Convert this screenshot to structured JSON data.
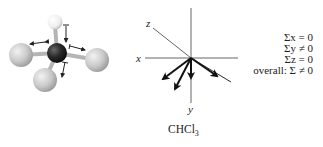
{
  "figure": {
    "molecule": {
      "name": "CHCl3 ball-and-stick model",
      "atoms": [
        {
          "element": "H",
          "label": "hydrogen",
          "color": "#f4f4f4"
        },
        {
          "element": "C",
          "label": "carbon",
          "color": "#2a2a2a"
        },
        {
          "element": "Cl",
          "label": "chlorine-left",
          "color": "#c8c8c8"
        },
        {
          "element": "Cl",
          "label": "chlorine-right",
          "color": "#c8c8c8"
        },
        {
          "element": "Cl",
          "label": "chlorine-bottom",
          "color": "#c8c8c8"
        }
      ]
    },
    "axes": {
      "x_label": "x",
      "y_label": "y",
      "z_label": "z"
    },
    "caption": {
      "formula_main": "CHCl",
      "formula_sub": "3"
    },
    "sums": [
      {
        "text": "Σx = 0"
      },
      {
        "text": "Σy ≠ 0"
      },
      {
        "text": "Σz = 0"
      },
      {
        "text": "overall: Σ ≠ 0"
      }
    ],
    "colors": {
      "ink": "#222222",
      "axis": "#555555",
      "background": "#ffffff"
    }
  }
}
